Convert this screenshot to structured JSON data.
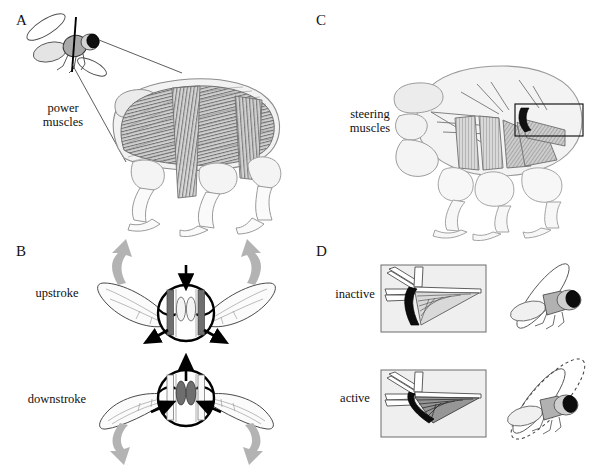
{
  "figure": {
    "width": 606,
    "height": 466,
    "background": "#ffffff",
    "ink": "#111111",
    "line_gray": "#8a8a8a",
    "fill_light": "#efefef",
    "fill_mid": "#b8b8b8",
    "fill_dark": "#6f6f6f",
    "arrow_gray": "#b0b0b0"
  },
  "panels": [
    {
      "id": "A",
      "letter": "A",
      "letter_x": 16,
      "letter_y": 22,
      "label": "power\nmuscles",
      "label_line1": "power",
      "label_line2": "muscles",
      "label_x": 58,
      "label_y": 108,
      "description": "Fly with vertical section plane through thorax, magnified thorax showing power muscles"
    },
    {
      "id": "B",
      "letter": "B",
      "letter_x": 16,
      "letter_y": 248,
      "rows": [
        {
          "label": "upstroke",
          "label_x": 36,
          "label_y": 292
        },
        {
          "label": "downstroke",
          "label_x": 27,
          "label_y": 395
        }
      ],
      "description": "Thorax cross-sections during upstroke and downstroke with wing motion arrows"
    },
    {
      "id": "C",
      "letter": "C",
      "letter_x": 316,
      "letter_y": 22,
      "label_line1": "steering",
      "label_line2": "muscles",
      "label_x": 340,
      "label_y": 114,
      "description": "Transparent thorax showing fan-shaped steering muscles with inset box"
    },
    {
      "id": "D",
      "letter": "D",
      "letter_x": 316,
      "letter_y": 248,
      "rows": [
        {
          "label": "inactive",
          "label_x": 335,
          "label_y": 293
        },
        {
          "label": "active",
          "label_x": 342,
          "label_y": 397
        }
      ],
      "description": "Steering muscle inactive vs active with corresponding wing stroke envelopes"
    }
  ]
}
